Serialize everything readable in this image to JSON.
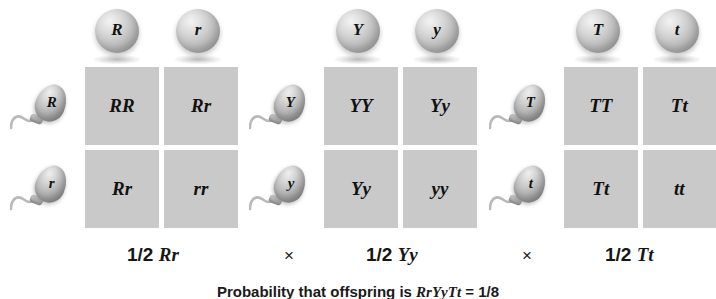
{
  "figure": {
    "type": "punnett-square-series",
    "background_color": "#ffffff",
    "cell_color": "#c9c9c9",
    "gamete_color": "#bdbdbd"
  },
  "crosses": [
    {
      "id": "cross-r",
      "egg_gametes": [
        "R",
        "r"
      ],
      "sperm_gametes": [
        "R",
        "r"
      ],
      "cells": [
        "RR",
        "Rr",
        "Rr",
        "rr"
      ],
      "probability": "1/2",
      "genotype": "Rr",
      "operator": ""
    },
    {
      "id": "cross-y",
      "egg_gametes": [
        "Y",
        "y"
      ],
      "sperm_gametes": [
        "Y",
        "y"
      ],
      "cells": [
        "YY",
        "Yy",
        "Yy",
        "yy"
      ],
      "probability": "1/2",
      "genotype": "Yy",
      "operator": "×"
    },
    {
      "id": "cross-t",
      "egg_gametes": [
        "T",
        "t"
      ],
      "sperm_gametes": [
        "T",
        "t"
      ],
      "cells": [
        "TT",
        "Tt",
        "Tt",
        "tt"
      ],
      "probability": "1/2",
      "genotype": "Tt",
      "operator": "×"
    }
  ],
  "caption": {
    "text_prefix": "Probability that offspring is ",
    "genotype": "RrYyTt",
    "text_suffix": " = 1/8",
    "full": "Probability that offspring is RrYyTt = 1/8"
  }
}
